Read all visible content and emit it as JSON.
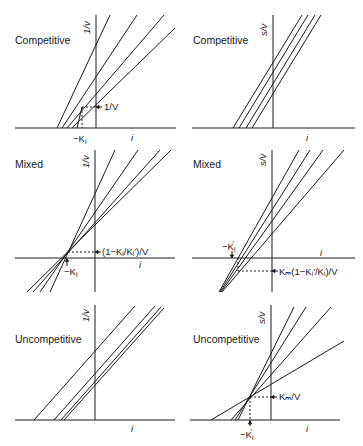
{
  "figure": {
    "ink_color": "#1a1a1a",
    "background_color": "#ffffff"
  },
  "panels": [
    {
      "id": "competitive-1v",
      "title": "Competitive",
      "y_label": "1/v",
      "x_label": "i",
      "annotations": {
        "point_y": "1/V",
        "point_x": "−K",
        "point_x_sub": "i"
      }
    },
    {
      "id": "competitive-sv",
      "title": "Competitive",
      "y_label": "s/v",
      "x_label": "i"
    },
    {
      "id": "mixed-1v",
      "title": "Mixed",
      "y_label": "1/v",
      "x_label": "i",
      "annotations": {
        "point_y": "(1−Kᵢ/Kᵢ′)/V",
        "point_x": "−K",
        "point_x_sub": "i"
      }
    },
    {
      "id": "mixed-sv",
      "title": "Mixed",
      "y_label": "s/v",
      "x_label": "i",
      "annotations": {
        "point_y": "Kₘ(1−Kᵢ′/Kᵢ)/V",
        "point_x": "−K",
        "point_x_sub": "i",
        "point_x_prime": "′"
      }
    },
    {
      "id": "uncompetitive-1v",
      "title": "Uncompetitive",
      "y_label": "1/v",
      "x_label": "i"
    },
    {
      "id": "uncompetitive-sv",
      "title": "Uncompetitive",
      "y_label": "s/v",
      "x_label": "i",
      "annotations": {
        "point_y": "Kₘ/V",
        "point_x": "−K",
        "point_x_sub": "i",
        "point_x_prime": "′"
      }
    }
  ]
}
